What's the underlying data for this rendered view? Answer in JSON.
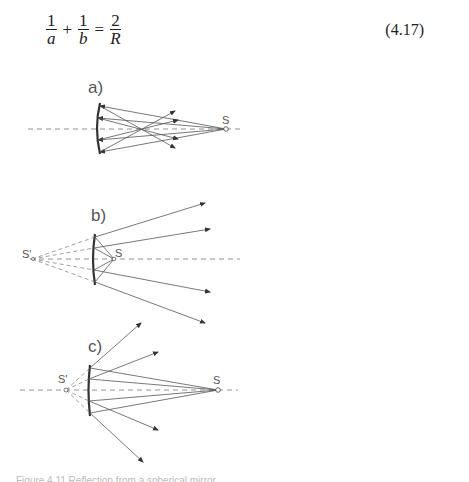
{
  "equation": {
    "terms": [
      {
        "numerator": "1",
        "denominator": "a"
      },
      {
        "numerator": "1",
        "denominator": "b"
      },
      {
        "numerator": "2",
        "denominator": "R"
      }
    ],
    "operators": [
      "+",
      "="
    ],
    "number": "(4.17)"
  },
  "figure": {
    "panels": [
      {
        "label": "a)",
        "source_label": "S"
      },
      {
        "label": "b)",
        "source_label": "S",
        "image_label": "S'"
      },
      {
        "label": "c)",
        "source_label": "S",
        "image_label": "S'"
      }
    ],
    "line_color": "#555555",
    "mirror_color": "#333333"
  },
  "caption": {
    "text": "Figure 4.11 Reflection from a spherical mirror"
  }
}
